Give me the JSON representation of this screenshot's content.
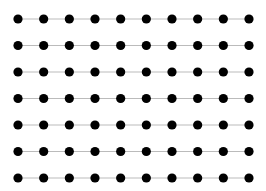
{
  "diagram": {
    "type": "node-grid",
    "rows": 7,
    "columns": 10,
    "edges": "horizontal-within-row",
    "node_color": "#000000",
    "edge_color": "#bbbbbb",
    "background": "#ffffff"
  }
}
